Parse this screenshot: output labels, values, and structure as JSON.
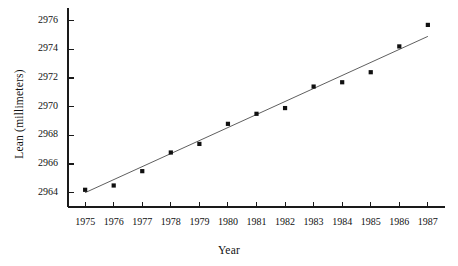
{
  "chart_data": {
    "type": "scatter",
    "title": "",
    "xlabel": "Year",
    "ylabel": "Lean (millimeters)",
    "x": [
      1975,
      1976,
      1977,
      1978,
      1979,
      1980,
      1981,
      1982,
      1983,
      1984,
      1985,
      1986,
      1987
    ],
    "values": [
      2964.2,
      2964.5,
      2965.5,
      2966.8,
      2967.4,
      2968.8,
      2969.5,
      2969.9,
      2971.4,
      2971.7,
      2972.4,
      2974.2,
      2975.7
    ],
    "series": [
      {
        "name": "Lean",
        "values": [
          2964.2,
          2964.5,
          2965.5,
          2966.8,
          2967.4,
          2968.8,
          2969.5,
          2969.9,
          2971.4,
          2971.7,
          2972.4,
          2974.2,
          2975.7
        ]
      }
    ],
    "trend_line": {
      "name": "least-squares fit",
      "x_start": 1975,
      "y_start": 2964.0,
      "x_end": 1987,
      "y_end": 2974.9
    },
    "xlim": [
      1974.4,
      1987.6
    ],
    "ylim": [
      2963.0,
      2976.6
    ],
    "xticks": [
      1975,
      1976,
      1977,
      1978,
      1979,
      1980,
      1981,
      1982,
      1983,
      1984,
      1985,
      1986,
      1987
    ],
    "xtick_labels": [
      "1975",
      "1976",
      "1977",
      "1978",
      "1979",
      "1980",
      "1981",
      "1982",
      "1983",
      "1984",
      "1985",
      "1986",
      "1987"
    ],
    "yticks": [
      2964,
      2966,
      2968,
      2970,
      2972,
      2974,
      2976
    ],
    "ytick_labels": [
      "2964",
      "2966",
      "2968",
      "2970",
      "2972",
      "2974",
      "2976"
    ],
    "grid": false,
    "legend": "none",
    "marker": "filled-square",
    "marker_color": "#101010",
    "line_color": "#4d4d4d",
    "axis_color": "#1a1a1a"
  }
}
